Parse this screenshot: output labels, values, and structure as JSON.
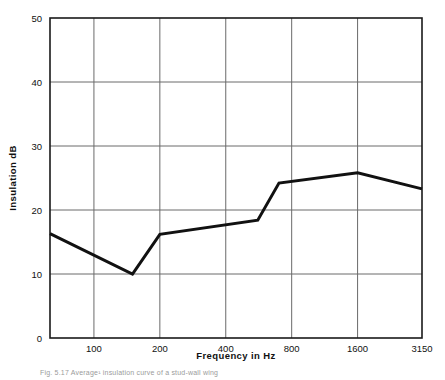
{
  "figure": {
    "caption": "Fig. 5.17  Average¹ insulation curve of a stud-wall wing"
  },
  "chart_data": {
    "type": "line",
    "title": "",
    "subtitle": "",
    "xlabel": "Frequency  in  Hz",
    "ylabel": "Insulation  dB",
    "xscale": "log",
    "yscale": "linear",
    "xlim": [
      63,
      3150
    ],
    "ylim": [
      0,
      50
    ],
    "grid": true,
    "legend": null,
    "x_tick_labels": [
      "100",
      "200",
      "400",
      "800",
      "1600",
      "3150"
    ],
    "x_tick_values": [
      100,
      200,
      400,
      800,
      1600,
      3150
    ],
    "y_tick_labels": [
      "0",
      "10",
      "20",
      "30",
      "40",
      "50"
    ],
    "y_tick_values": [
      0,
      10,
      20,
      30,
      40,
      50
    ],
    "series": [
      {
        "name": "Insulation",
        "color": "#111111",
        "line_width": 3,
        "x": [
          63,
          150,
          200,
          560,
          700,
          1600,
          3150
        ],
        "values": [
          16.3,
          10.0,
          16.2,
          18.4,
          24.2,
          25.8,
          23.3
        ]
      }
    ],
    "points": [
      {
        "frequency": 63,
        "insulation_db": 16.3
      },
      {
        "frequency": 150,
        "insulation_db": 10.0
      },
      {
        "frequency": 200,
        "insulation_db": 16.2
      },
      {
        "frequency": 560,
        "insulation_db": 18.4
      },
      {
        "frequency": 700,
        "insulation_db": 24.2
      },
      {
        "frequency": 1600,
        "insulation_db": 25.8
      },
      {
        "frequency": 3150,
        "insulation_db": 23.3
      }
    ]
  },
  "style": {
    "line_color": "#111111",
    "grid_color": "#6a6a6a",
    "frame_color": "#1a1a1a",
    "background": "#ffffff"
  }
}
